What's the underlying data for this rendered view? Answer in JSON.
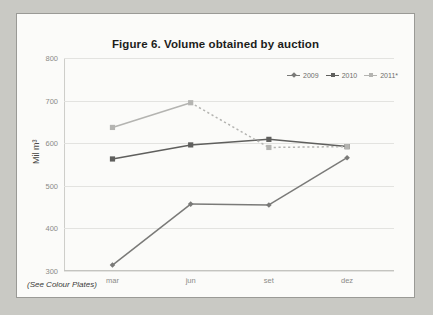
{
  "figure": {
    "title": "Figure 6. Volume obtained by auction",
    "caption": "(See Colour Plates)"
  },
  "axes": {
    "y_title": "Mil m³",
    "y_ticks": [
      "800",
      "700",
      "600",
      "500",
      "400",
      "300"
    ],
    "x_ticks": [
      "mar",
      "jun",
      "set",
      "dez"
    ]
  },
  "legend": {
    "items": [
      {
        "label": "2009",
        "color": "#7a7a78"
      },
      {
        "label": "2010",
        "color": "#5f5f5d"
      },
      {
        "label": "2011*",
        "color": "#b4b4b1"
      }
    ]
  },
  "chart_data": {
    "type": "line",
    "title": "Figure 6. Volume obtained by auction",
    "subtitle": "",
    "xlabel": "",
    "ylabel": "Mil m³",
    "categories": [
      "mar",
      "jun",
      "set",
      "dez"
    ],
    "series": [
      {
        "name": "2009",
        "color": "#7a7a78",
        "style": "solid",
        "marker": "diamond",
        "values": [
          314,
          457,
          455,
          566
        ]
      },
      {
        "name": "2010",
        "color": "#5f5f5d",
        "style": "solid",
        "marker": "square",
        "values": [
          563,
          596,
          609,
          592
        ]
      },
      {
        "name": "2011*",
        "color": "#b4b4b1",
        "style": "solid-then-dashed",
        "marker": "square",
        "values": [
          637,
          695,
          590,
          592
        ]
      }
    ],
    "ylim": [
      300,
      800
    ],
    "ytick_step": 100,
    "grid": true,
    "legend_position": "top-right"
  }
}
